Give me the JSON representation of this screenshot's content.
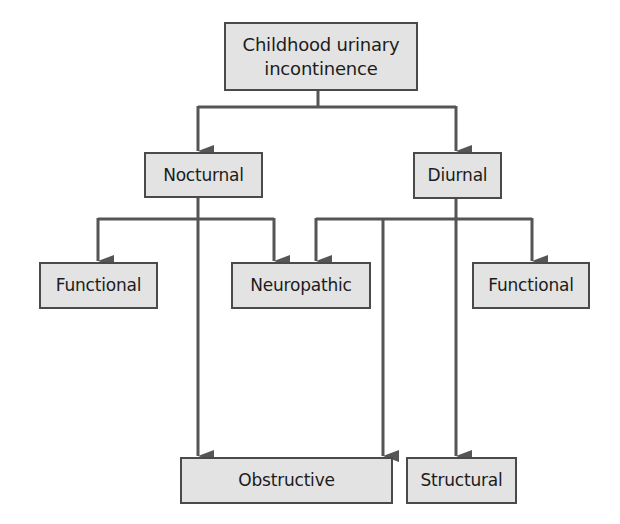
{
  "diagram": {
    "type": "hierarchy",
    "colors": {
      "box_fill": "#e3e3e3",
      "box_border": "#4a4a4a",
      "line": "#555555",
      "text": "#1c1c1c"
    },
    "nodes": {
      "root": {
        "label_line1": "Childhood urinary",
        "label_line2": "incontinence"
      },
      "nocturnal": {
        "label": "Nocturnal"
      },
      "diurnal": {
        "label": "Diurnal"
      },
      "functional_left": {
        "label": "Functional"
      },
      "neuropathic": {
        "label": "Neuropathic"
      },
      "functional_right": {
        "label": "Functional"
      },
      "obstructive": {
        "label": "Obstructive"
      },
      "structural": {
        "label": "Structural"
      }
    },
    "edges": [
      {
        "from": "Childhood urinary incontinence",
        "to": "Nocturnal"
      },
      {
        "from": "Childhood urinary incontinence",
        "to": "Diurnal"
      },
      {
        "from": "Nocturnal",
        "to": "Functional"
      },
      {
        "from": "Nocturnal",
        "to": "Neuropathic"
      },
      {
        "from": "Nocturnal",
        "to": "Obstructive"
      },
      {
        "from": "Diurnal",
        "to": "Neuropathic"
      },
      {
        "from": "Diurnal",
        "to": "Obstructive"
      },
      {
        "from": "Diurnal",
        "to": "Structural"
      },
      {
        "from": "Diurnal",
        "to": "Functional"
      }
    ]
  }
}
